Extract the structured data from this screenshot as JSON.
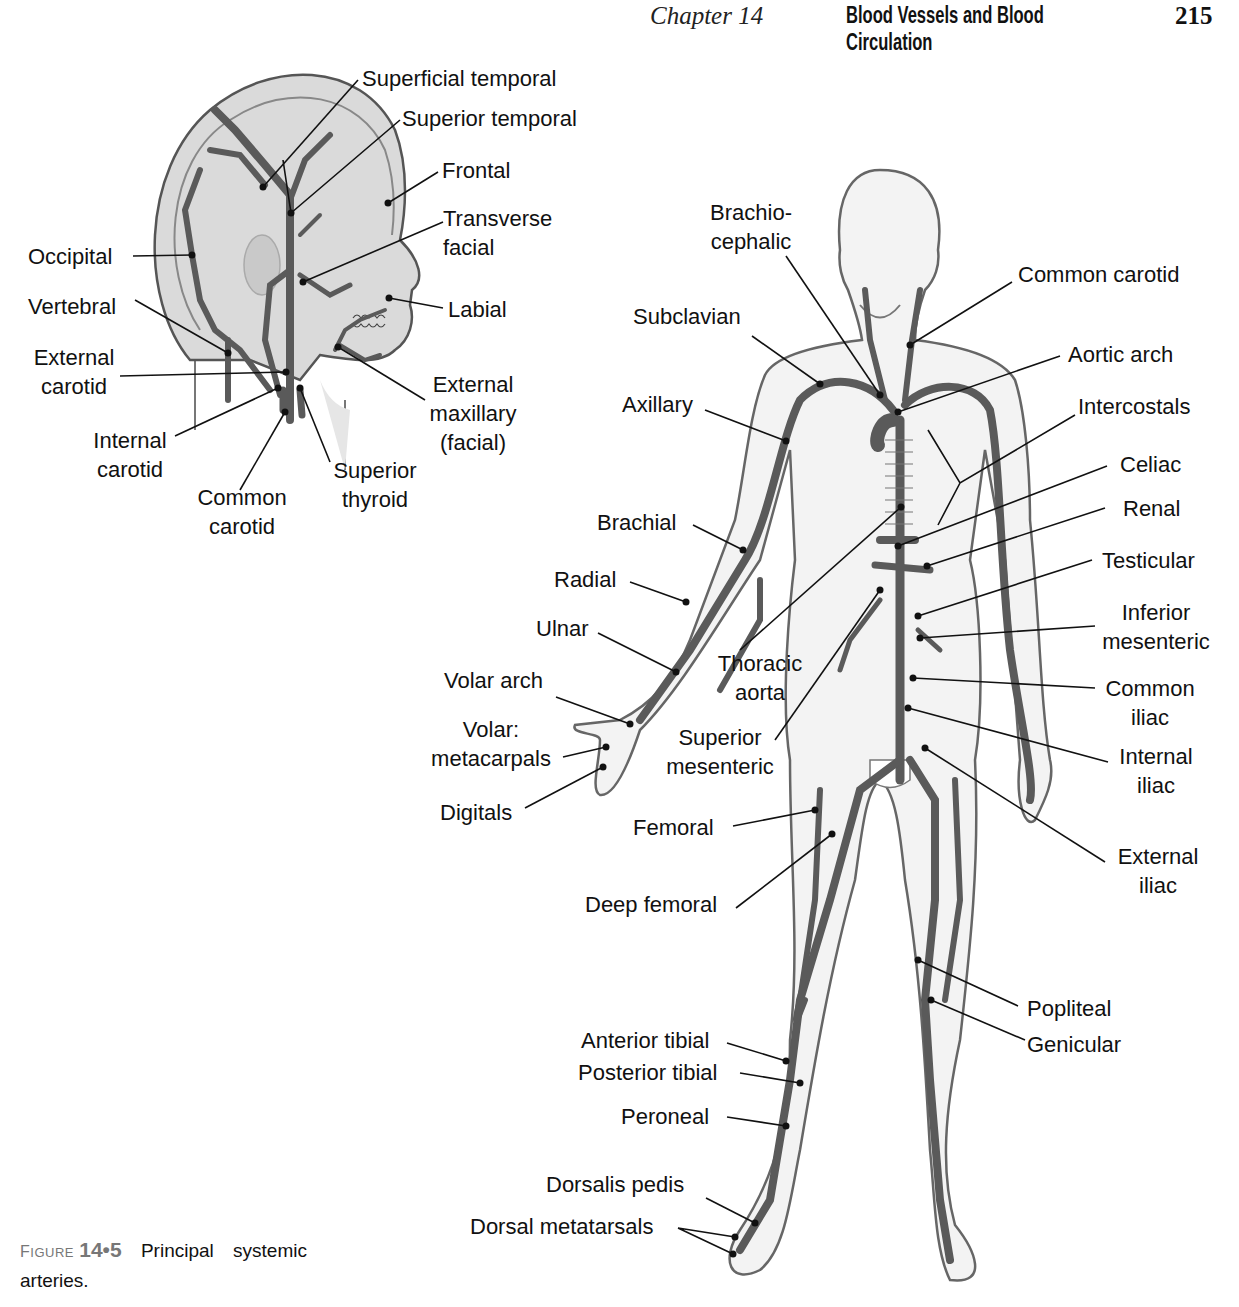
{
  "header": {
    "chapter": "Chapter 14",
    "title": "Blood Vessels and Blood Circulation",
    "page_number": "215"
  },
  "caption": {
    "figure_word": "Figure",
    "figure_number": "14•5",
    "text_line1": "Principal systemic",
    "text_line2": "arteries."
  },
  "head_labels": {
    "superficial_temporal": "Superficial temporal",
    "superior_temporal": "Superior temporal",
    "frontal": "Frontal",
    "transverse_facial": [
      "Transverse",
      "facial"
    ],
    "occipital": "Occipital",
    "labial": "Labial",
    "vertebral": "Vertebral",
    "external_carotid": [
      "External",
      "carotid"
    ],
    "external_maxillary": [
      "External",
      "maxillary",
      "(facial)"
    ],
    "internal_carotid": [
      "Internal",
      "carotid"
    ],
    "common_carotid": [
      "Common",
      "carotid"
    ],
    "superior_thyroid": [
      "Superior",
      "thyroid"
    ]
  },
  "body_labels": {
    "brachiocephalic": [
      "Brachio-",
      "cephalic"
    ],
    "common_carotid": "Common carotid",
    "subclavian": "Subclavian",
    "aortic_arch": "Aortic arch",
    "axillary": "Axillary",
    "intercostals": "Intercostals",
    "celiac": "Celiac",
    "renal": "Renal",
    "brachial": "Brachial",
    "testicular": "Testicular",
    "radial": "Radial",
    "inferior_mesenteric": [
      "Inferior",
      "mesenteric"
    ],
    "ulnar": "Ulnar",
    "thoracic_aorta": [
      "Thoracic",
      "aorta"
    ],
    "volar_arch": "Volar arch",
    "common_iliac": [
      "Common",
      "iliac"
    ],
    "volar_metacarpals": [
      "Volar:",
      "metacarpals"
    ],
    "superior_mesenteric": [
      "Superior",
      "mesenteric"
    ],
    "internal_iliac": [
      "Internal",
      "iliac"
    ],
    "digitals": "Digitals",
    "femoral": "Femoral",
    "external_iliac": [
      "External",
      "iliac"
    ],
    "deep_femoral": "Deep femoral",
    "popliteal": "Popliteal",
    "genicular": "Genicular",
    "anterior_tibial": "Anterior tibial",
    "posterior_tibial": "Posterior tibial",
    "peroneal": "Peroneal",
    "dorsalis_pedis": "Dorsalis pedis",
    "dorsal_metatarsals": "Dorsal metatarsals"
  },
  "colors": {
    "artery": "#5a5a5a",
    "skin_fill": "#f2f2f2",
    "head_fill": "#d9d9d9",
    "outline": "#555555",
    "leader": "#111111"
  }
}
